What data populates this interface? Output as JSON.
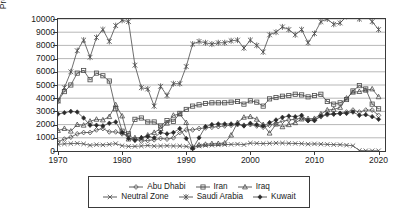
{
  "chart_data": {
    "type": "line",
    "title": "",
    "xlabel": "",
    "ylabel": "Production kb/d",
    "xlim": [
      1970,
      2021
    ],
    "ylim": [
      0,
      10000
    ],
    "grid": true,
    "legend_position": "bottom",
    "xticks": [
      "1970",
      "1980",
      "1990",
      "2000",
      "2010",
      "2020"
    ],
    "xtick_values": [
      1970,
      1980,
      1990,
      2000,
      2010,
      2020
    ],
    "yticks": [
      "0",
      "1000",
      "2000",
      "3000",
      "4000",
      "5000",
      "6000",
      "7000",
      "8000",
      "9000",
      "10000"
    ],
    "ytick_values": [
      0,
      1000,
      2000,
      3000,
      4000,
      5000,
      6000,
      7000,
      8000,
      9000,
      10000
    ],
    "x": [
      1970,
      1971,
      1972,
      1973,
      1974,
      1975,
      1976,
      1977,
      1978,
      1979,
      1980,
      1981,
      1982,
      1983,
      1984,
      1985,
      1986,
      1987,
      1988,
      1989,
      1990,
      1991,
      1992,
      1993,
      1994,
      1995,
      1996,
      1997,
      1998,
      1999,
      2000,
      2001,
      2002,
      2003,
      2004,
      2005,
      2006,
      2007,
      2008,
      2009,
      2010,
      2011,
      2012,
      2013,
      2014,
      2015,
      2016,
      2017,
      2018,
      2019,
      2020
    ],
    "series": [
      {
        "name": "Abu Dhabi",
        "marker": "diamond",
        "values": [
          700,
          900,
          1050,
          1300,
          1400,
          1400,
          1600,
          1700,
          1450,
          1450,
          1300,
          1200,
          900,
          750,
          800,
          850,
          950,
          900,
          1000,
          1400,
          1600,
          1600,
          1700,
          1750,
          1800,
          1850,
          1900,
          1950,
          2000,
          1950,
          2000,
          1900,
          1800,
          1950,
          2100,
          2250,
          2350,
          2400,
          2500,
          2300,
          2400,
          2600,
          2750,
          2800,
          2850,
          2950,
          3100,
          2950,
          3100,
          3100,
          2700
        ]
      },
      {
        "name": "Iran",
        "marker": "square",
        "values": [
          3800,
          4500,
          5000,
          5900,
          6100,
          5400,
          5900,
          5700,
          5300,
          3200,
          1500,
          1300,
          2400,
          2500,
          2200,
          2200,
          1900,
          2300,
          2250,
          2850,
          3150,
          3400,
          3500,
          3600,
          3650,
          3650,
          3650,
          3700,
          3750,
          3550,
          3800,
          3700,
          3400,
          3950,
          4050,
          4150,
          4200,
          4300,
          4250,
          4100,
          4200,
          4300,
          3750,
          3550,
          3650,
          3900,
          4550,
          4950,
          4700,
          3550,
          3200
        ]
      },
      {
        "name": "Iraq",
        "marker": "triangle",
        "values": [
          1550,
          1700,
          1500,
          2000,
          1950,
          2250,
          2400,
          2350,
          2600,
          3500,
          2650,
          900,
          1000,
          1000,
          1200,
          1400,
          1700,
          2100,
          2700,
          2800,
          2150,
          300,
          450,
          500,
          550,
          560,
          600,
          1200,
          2150,
          2550,
          2600,
          2400,
          2000,
          1350,
          2030,
          1830,
          1990,
          2140,
          2420,
          2450,
          2460,
          2800,
          3100,
          3150,
          3300,
          4000,
          4450,
          4500,
          4600,
          4700,
          4100
        ]
      },
      {
        "name": "Neutral Zone",
        "marker": "cross",
        "values": [
          500,
          540,
          560,
          580,
          540,
          430,
          480,
          460,
          500,
          560,
          400,
          350,
          350,
          380,
          420,
          370,
          380,
          400,
          380,
          380,
          350,
          250,
          380,
          420,
          440,
          460,
          480,
          500,
          520,
          480,
          600,
          580,
          560,
          580,
          600,
          600,
          580,
          570,
          560,
          520,
          540,
          520,
          500,
          480,
          480,
          440,
          400,
          40,
          20,
          20,
          20
        ]
      },
      {
        "name": "Saudi Arabia",
        "marker": "asterisk",
        "values": [
          3800,
          4800,
          6000,
          7600,
          8400,
          7100,
          8600,
          9200,
          8300,
          9500,
          9900,
          9800,
          6500,
          4800,
          4700,
          3400,
          4900,
          4200,
          5100,
          5100,
          6400,
          8100,
          8300,
          8200,
          8100,
          8200,
          8200,
          8350,
          8400,
          7800,
          8400,
          8000,
          7500,
          8800,
          9000,
          9400,
          9200,
          8800,
          9200,
          8200,
          8900,
          9800,
          10000,
          9600,
          9700,
          10200,
          10500,
          10000,
          10300,
          9800,
          9200
        ]
      },
      {
        "name": "Kuwait",
        "marker": "filled-diamond",
        "values": [
          2800,
          2900,
          3000,
          2950,
          2500,
          1950,
          1950,
          1900,
          2100,
          2200,
          1400,
          950,
          800,
          1000,
          1100,
          1000,
          1400,
          1300,
          1400,
          1700,
          950,
          180,
          1000,
          1850,
          2000,
          2050,
          2050,
          2050,
          2050,
          1900,
          2100,
          2000,
          1900,
          2150,
          2350,
          2550,
          2650,
          2600,
          2700,
          2300,
          2300,
          2650,
          2800,
          2800,
          2850,
          2850,
          2950,
          2700,
          2750,
          2600,
          2400
        ]
      }
    ]
  },
  "legend": {
    "items": [
      {
        "label": "Abu Dhabi"
      },
      {
        "label": "Iran"
      },
      {
        "label": "Iraq"
      },
      {
        "label": "Neutral Zone"
      },
      {
        "label": "Saudi Arabia"
      },
      {
        "label": "Kuwait"
      }
    ]
  },
  "colors": {
    "axis": "#3a3a3a",
    "grid": "#9a9a9a",
    "line": "#4a4a4a",
    "background": "#ffffff"
  }
}
